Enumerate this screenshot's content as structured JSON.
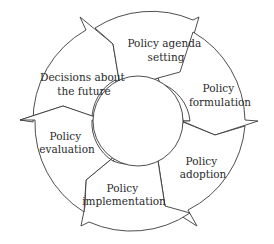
{
  "diagram": {
    "type": "policy-cycle",
    "stages": [
      {
        "id": "agenda",
        "lines": [
          "Policy agenda",
          "setting"
        ]
      },
      {
        "id": "formulation",
        "lines": [
          "Policy",
          "formulation"
        ]
      },
      {
        "id": "adoption",
        "lines": [
          "Policy",
          "adoption"
        ]
      },
      {
        "id": "implementation",
        "lines": [
          "Policy",
          "implementation"
        ]
      },
      {
        "id": "evaluation",
        "lines": [
          "Policy",
          "evaluation"
        ]
      },
      {
        "id": "decisions",
        "lines": [
          "Decisions about",
          "the future"
        ]
      }
    ],
    "colors": {
      "stroke": "#3a3a3a",
      "text": "#2a2a2a",
      "background": "#ffffff"
    }
  }
}
